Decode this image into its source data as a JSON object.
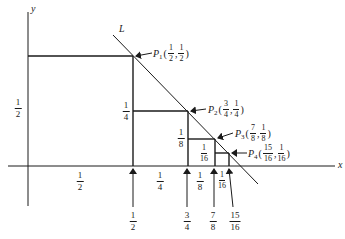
{
  "diagram": {
    "axes": {
      "x_label": "x",
      "y_label": "y"
    },
    "line": {
      "label": "L"
    },
    "points": [
      {
        "name": "P",
        "sub": "1",
        "x_num": "1",
        "x_den": "2",
        "y_num": "1",
        "y_den": "2"
      },
      {
        "name": "P",
        "sub": "2",
        "x_num": "3",
        "x_den": "4",
        "y_num": "1",
        "y_den": "4"
      },
      {
        "name": "P",
        "sub": "3",
        "x_num": "7",
        "x_den": "8",
        "y_num": "1",
        "y_den": "8"
      },
      {
        "name": "P",
        "sub": "4",
        "x_num": "15",
        "x_den": "16",
        "y_num": "1",
        "y_den": "16"
      }
    ],
    "height_labels": [
      {
        "num": "1",
        "den": "2"
      },
      {
        "num": "1",
        "den": "4"
      },
      {
        "num": "1",
        "den": "8"
      },
      {
        "num": "1",
        "den": "16"
      }
    ],
    "width_labels": [
      {
        "num": "1",
        "den": "2"
      },
      {
        "num": "1",
        "den": "4"
      },
      {
        "num": "1",
        "den": "8"
      },
      {
        "num": "1",
        "den": "16"
      }
    ],
    "x_markers": [
      {
        "num": "1",
        "den": "2"
      },
      {
        "num": "3",
        "den": "4"
      },
      {
        "num": "7",
        "den": "8"
      },
      {
        "num": "15",
        "den": "16"
      }
    ],
    "colors": {
      "ink": "#1a1a1a",
      "background": "#ffffff"
    }
  }
}
